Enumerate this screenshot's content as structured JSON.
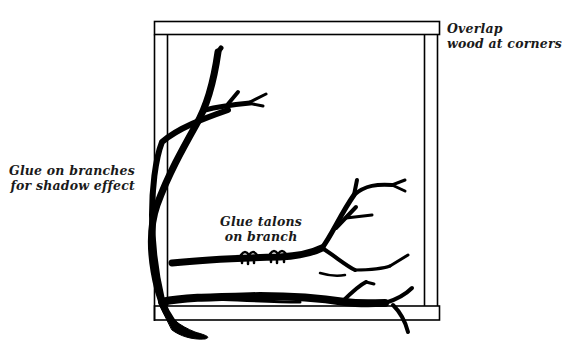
{
  "diagram": {
    "type": "craft-illustration",
    "colors": {
      "ink": "#000000",
      "background": "#ffffff",
      "label": "#1a1a1a"
    },
    "labels": {
      "overlap": {
        "line1": "Overlap",
        "line2": "wood at corners"
      },
      "glue_branches": {
        "line1": "Glue on branches",
        "line2": "for shadow effect"
      },
      "glue_talons": {
        "line1": "Glue talons",
        "line2": "on branch"
      }
    }
  }
}
